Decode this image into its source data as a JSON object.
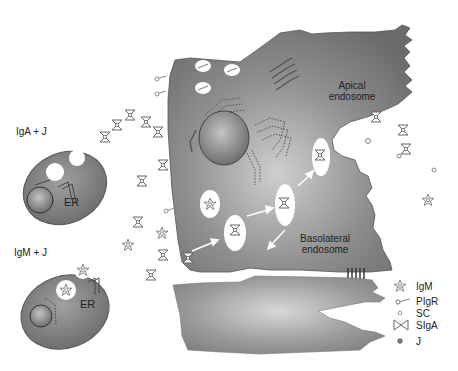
{
  "diagram": {
    "type": "biological process: polymeric Ig transcytosis across epithelial cell",
    "plasma_cells": [
      {
        "id": "iga-cell",
        "label": "IgA + J",
        "organelle_label": "ER"
      },
      {
        "id": "igm-cell",
        "label": "IgM + J",
        "organelle_label": "ER"
      }
    ],
    "epithelial_cell": {
      "compartments": [
        {
          "id": "apical-endosome",
          "label": "Apical\nendosome",
          "label_lines": [
            "Apical",
            "endosome"
          ]
        },
        {
          "id": "basolateral-endosome",
          "label": "Basolateral\nendosome",
          "label_lines": [
            "Basolateral",
            "endosome"
          ]
        }
      ]
    },
    "legend": [
      {
        "symbol": "star",
        "icon": "igm-star-icon",
        "label": "IgM"
      },
      {
        "symbol": "lollipop",
        "icon": "pigr-icon",
        "label": "PIgR"
      },
      {
        "symbol": "small-c",
        "icon": "sc-icon",
        "label": "SC"
      },
      {
        "symbol": "bowtie",
        "icon": "siga-bowtie-icon",
        "label": "SIgA"
      },
      {
        "symbol": "dot",
        "icon": "j-chain-icon",
        "label": "J"
      }
    ],
    "colors": {
      "cell_fill": "#7a7a7a",
      "cell_highlight": "#c8c8c8",
      "nucleus": "#8c8c8c",
      "vesicle": "#ffffff",
      "arrow": "#ffffff",
      "molecule_stroke": "#666666"
    }
  }
}
